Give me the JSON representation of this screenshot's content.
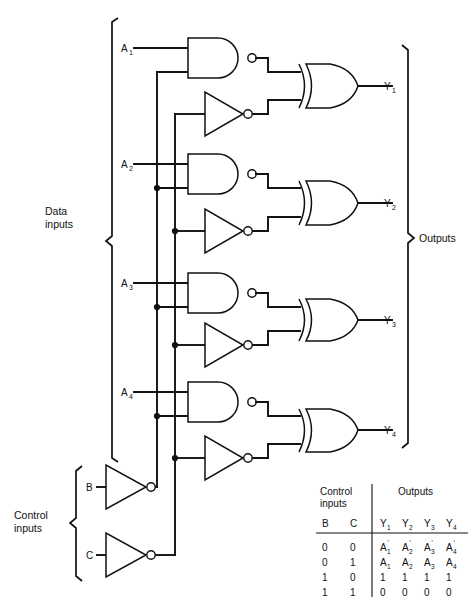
{
  "figure": {
    "type": "logic-circuit-diagram"
  },
  "groups": {
    "data_inputs_label": "Data inputs",
    "control_inputs_label": "Control inputs",
    "outputs_label": "Outputs"
  },
  "data_inputs": [
    {
      "label": "A",
      "sub": "1"
    },
    {
      "label": "A",
      "sub": "2"
    },
    {
      "label": "A",
      "sub": "3"
    },
    {
      "label": "A",
      "sub": "4"
    }
  ],
  "control_inputs": [
    {
      "label": "B"
    },
    {
      "label": "C"
    }
  ],
  "outputs": [
    {
      "label": "Y",
      "sub": "1"
    },
    {
      "label": "Y",
      "sub": "2"
    },
    {
      "label": "Y",
      "sub": "3"
    },
    {
      "label": "Y",
      "sub": "4"
    }
  ],
  "gates": [
    {
      "stage": 1,
      "nand": "nand-gate-1",
      "inverter": "inverter-1",
      "xor": "xor-gate-1"
    },
    {
      "stage": 2,
      "nand": "nand-gate-2",
      "inverter": "inverter-2",
      "xor": "xor-gate-2"
    },
    {
      "stage": 3,
      "nand": "nand-gate-3",
      "inverter": "inverter-3",
      "xor": "xor-gate-3"
    },
    {
      "stage": 4,
      "nand": "nand-gate-4",
      "inverter": "inverter-4",
      "xor": "xor-gate-4"
    }
  ],
  "control_gates": [
    {
      "name": "inverter-b",
      "input": "B"
    },
    {
      "name": "inverter-c",
      "input": "C"
    }
  ],
  "truth_table": {
    "group_headers": {
      "control": "Control inputs",
      "control_line1": "Control",
      "control_line2": "inputs",
      "outputs": "Outputs"
    },
    "columns": [
      {
        "label": "B",
        "sub": ""
      },
      {
        "label": "C",
        "sub": ""
      },
      {
        "label": "Y",
        "sub": "1"
      },
      {
        "label": "Y",
        "sub": "2"
      },
      {
        "label": "Y",
        "sub": "3"
      },
      {
        "label": "Y",
        "sub": "4"
      }
    ],
    "rows": [
      [
        {
          "t": "0",
          "s": "",
          "p": false
        },
        {
          "t": "0",
          "s": "",
          "p": false
        },
        {
          "t": "A",
          "s": "1",
          "p": true
        },
        {
          "t": "A",
          "s": "2",
          "p": true
        },
        {
          "t": "A",
          "s": "3",
          "p": true
        },
        {
          "t": "A",
          "s": "4",
          "p": true
        }
      ],
      [
        {
          "t": "0",
          "s": "",
          "p": false
        },
        {
          "t": "1",
          "s": "",
          "p": false
        },
        {
          "t": "A",
          "s": "1",
          "p": false
        },
        {
          "t": "A",
          "s": "2",
          "p": false
        },
        {
          "t": "A",
          "s": "3",
          "p": false
        },
        {
          "t": "A",
          "s": "4",
          "p": false
        }
      ],
      [
        {
          "t": "1",
          "s": "",
          "p": false
        },
        {
          "t": "0",
          "s": "",
          "p": false
        },
        {
          "t": "1",
          "s": "",
          "p": false
        },
        {
          "t": "1",
          "s": "",
          "p": false
        },
        {
          "t": "1",
          "s": "",
          "p": false
        },
        {
          "t": "1",
          "s": "",
          "p": false
        }
      ],
      [
        {
          "t": "1",
          "s": "",
          "p": false
        },
        {
          "t": "1",
          "s": "",
          "p": false
        },
        {
          "t": "0",
          "s": "",
          "p": false
        },
        {
          "t": "0",
          "s": "",
          "p": false
        },
        {
          "t": "0",
          "s": "",
          "p": false
        },
        {
          "t": "0",
          "s": "",
          "p": false
        }
      ]
    ]
  },
  "colors": {
    "ink": "#111111",
    "paper": "#ffffff"
  }
}
